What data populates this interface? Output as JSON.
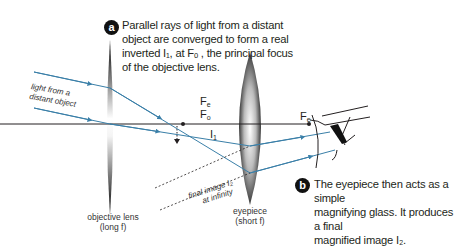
{
  "callout_a": {
    "badge": "a",
    "text_lines": [
      "Parallel rays of light from a distant",
      "object are converged to form a real",
      "inverted I₁, at Fₒ , the principal focus",
      "of the objective lens."
    ]
  },
  "callout_b": {
    "badge": "b",
    "text_lines": [
      "The eyepiece then acts as a simple",
      "magnifying glass. It produces a final",
      "magnified image I₂."
    ]
  },
  "labels": {
    "light_source_line1": "light from a",
    "light_source_line2": "distant object",
    "objective_line1": "objective lens",
    "objective_line2": "(long f)",
    "eyepiece_line1": "eyepiece",
    "eyepiece_line2": "(short f)",
    "final_image_line1": "final image I₂",
    "final_image_line2": "at infinity"
  },
  "symbols": {
    "Fe_top": "F",
    "Fe_top_sub": "e",
    "Fo": "F",
    "Fo_sub": "o",
    "I1": "I",
    "I1_sub": "1",
    "Fe_right": "F",
    "Fe_right_sub": "e"
  },
  "colors": {
    "ray": "#3a7fa8",
    "axis": "#231f20",
    "badge": "#111111"
  }
}
